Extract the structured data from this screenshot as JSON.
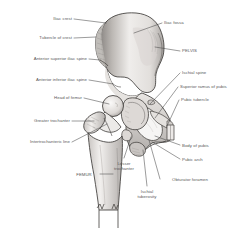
{
  "figure": {
    "title": "",
    "bone_fill": "#f0eeec",
    "bone_shade": "#b9b5b2",
    "bone_shade_dark": "#8f8b88",
    "outline_color": "#3f3c3a",
    "leader_color": "#4a4a4a",
    "label_color": "#585858",
    "background": "#ffffff"
  },
  "labels_left": [
    {
      "id": "iliac-crest",
      "text": "Iliac crest",
      "x": 28,
      "y": 16,
      "w": 44
    },
    {
      "id": "tubercle-of-crest",
      "text": "Tubercle of crest",
      "x": 17,
      "y": 35,
      "w": 55
    },
    {
      "id": "anterior-superior-iliac-spine",
      "text": "Anterior superior iliac spine",
      "x": 2,
      "y": 56,
      "w": 85
    },
    {
      "id": "anterior-inferior-iliac-spine",
      "text": "Anterior inferior iliac spine",
      "x": 5,
      "y": 77,
      "w": 82
    },
    {
      "id": "head-of-femur",
      "text": "Head of femur",
      "x": 35,
      "y": 95,
      "w": 47
    },
    {
      "id": "greater-trochanter",
      "text": "Greater trochanter",
      "x": 14,
      "y": 118,
      "w": 56
    },
    {
      "id": "intertrochanteric-line",
      "text": "Intertrochanteric line",
      "x": 8,
      "y": 139,
      "w": 62
    }
  ],
  "labels_right": [
    {
      "id": "iliac-fossa",
      "text": "Iliac fossa",
      "x": 164,
      "y": 20,
      "w": 38
    },
    {
      "id": "pelvis",
      "text": "PELVIS",
      "x": 182,
      "y": 48,
      "w": 30
    },
    {
      "id": "ischial-spine",
      "text": "Ischial spine",
      "x": 182,
      "y": 70,
      "w": 40
    },
    {
      "id": "superior-ramus-of-pubis",
      "text": "Superior ramus of pubis",
      "x": 180,
      "y": 84,
      "w": 70
    },
    {
      "id": "pubic-tubercle",
      "text": "Pubic tubercle",
      "x": 181,
      "y": 97,
      "w": 46
    },
    {
      "id": "body-of-pubis",
      "text": "Body of pubis",
      "x": 182,
      "y": 143,
      "w": 45
    },
    {
      "id": "pubic-arch",
      "text": "Pubic arch",
      "x": 182,
      "y": 157,
      "w": 38
    }
  ],
  "labels_bottom": [
    {
      "id": "femur",
      "text": "FEMUR",
      "x": 70,
      "y": 172,
      "w": 28
    },
    {
      "id": "lesser-trochanter",
      "text": "Lesser trochanter",
      "x": 111,
      "y": 161,
      "w": 26
    },
    {
      "id": "obturator-foramen",
      "text": "Obturator foramen",
      "x": 161,
      "y": 177,
      "w": 58
    },
    {
      "id": "ischial-tuberosity",
      "text": "Ischial tuberosity",
      "x": 134,
      "y": 189,
      "w": 26
    }
  ],
  "leader_lines": [
    {
      "id": "leader-iliac-crest",
      "x1": 74,
      "y1": 19,
      "x2": 106,
      "y2": 23
    },
    {
      "id": "leader-tubercle-of-crest",
      "x1": 74,
      "y1": 38,
      "x2": 96,
      "y2": 37
    },
    {
      "id": "leader-anterior-superior-iliac-spine",
      "x1": 89,
      "y1": 59,
      "x2": 100,
      "y2": 60
    },
    {
      "id": "leader-anterior-inferior-iliac-spine",
      "x1": 89,
      "y1": 80,
      "x2": 113,
      "y2": 84
    },
    {
      "id": "leader-head-of-femur",
      "x1": 84,
      "y1": 98,
      "x2": 109,
      "y2": 104
    },
    {
      "id": "leader-greater-trochanter",
      "x1": 72,
      "y1": 121,
      "x2": 94,
      "y2": 121
    },
    {
      "id": "leader-intertrochanteric-line",
      "x1": 72,
      "y1": 142,
      "x2": 107,
      "y2": 124
    },
    {
      "id": "leader-iliac-fossa",
      "x1": 162,
      "y1": 23,
      "x2": 134,
      "y2": 33
    },
    {
      "id": "leader-pelvis",
      "x1": 180,
      "y1": 51,
      "x2": 155,
      "y2": 47
    },
    {
      "id": "leader-ischial-spine",
      "x1": 180,
      "y1": 73,
      "x2": 150,
      "y2": 104
    },
    {
      "id": "leader-superior-ramus-of-pubis",
      "x1": 178,
      "y1": 87,
      "x2": 155,
      "y2": 118
    },
    {
      "id": "leader-pubic-tubercle",
      "x1": 179,
      "y1": 100,
      "x2": 167,
      "y2": 126
    },
    {
      "id": "leader-body-of-pubis",
      "x1": 180,
      "y1": 145,
      "x2": 155,
      "y2": 136
    },
    {
      "id": "leader-pubic-arch",
      "x1": 180,
      "y1": 159,
      "x2": 152,
      "y2": 142
    },
    {
      "id": "leader-femur",
      "x1": 100,
      "y1": 174,
      "x2": 113,
      "y2": 174
    },
    {
      "id": "leader-lesser-trochanter",
      "x1": 124,
      "y1": 158,
      "x2": 131,
      "y2": 137
    },
    {
      "id": "leader-obturator-foramen",
      "x1": 160,
      "y1": 179,
      "x2": 149,
      "y2": 140
    },
    {
      "id": "leader-ischial-tuberosity",
      "x1": 147,
      "y1": 186,
      "x2": 143,
      "y2": 150
    }
  ]
}
